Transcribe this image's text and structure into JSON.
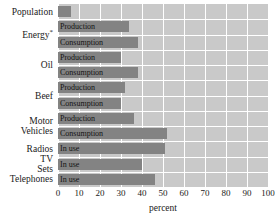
{
  "chart_data": {
    "type": "bar",
    "orientation": "horizontal",
    "title": "",
    "xlabel": "percent",
    "ylabel": "",
    "xlim": [
      0,
      100
    ],
    "xticks": [
      0,
      10,
      20,
      30,
      40,
      50,
      60,
      70,
      80,
      90,
      100
    ],
    "xtick_labels": [
      "0",
      "10",
      "20",
      "30",
      "40",
      "50",
      "60",
      "70",
      "80",
      "90",
      "100"
    ],
    "grid": true,
    "grid_color": "#ffffff",
    "plot_background": "#c9c9c9",
    "bar_color": "#838383",
    "legend": "none",
    "categories": [
      "Population",
      "Energy*",
      "Oil",
      "Beef",
      "Motor Vehicles",
      "Radios",
      "TV Sets",
      "Telephones"
    ],
    "bars": [
      {
        "category": "Population",
        "series": "",
        "value": 6
      },
      {
        "category": "Energy*",
        "series": "Production",
        "value": 34
      },
      {
        "category": "Energy*",
        "series": "Consumption",
        "value": 38
      },
      {
        "category": "Oil",
        "series": "Production",
        "value": 30
      },
      {
        "category": "Oil",
        "series": "Consumption",
        "value": 38
      },
      {
        "category": "Beef",
        "series": "Production",
        "value": 32
      },
      {
        "category": "Beef",
        "series": "Consumption",
        "value": 30
      },
      {
        "category": "Motor Vehicles",
        "series": "Production",
        "value": 36
      },
      {
        "category": "Motor Vehicles",
        "series": "Consumption",
        "value": 52
      },
      {
        "category": "Radios",
        "series": "In use",
        "value": 51
      },
      {
        "category": "TV Sets",
        "series": "In use",
        "value": 40
      },
      {
        "category": "Telephones",
        "series": "In use",
        "value": 46
      }
    ]
  }
}
